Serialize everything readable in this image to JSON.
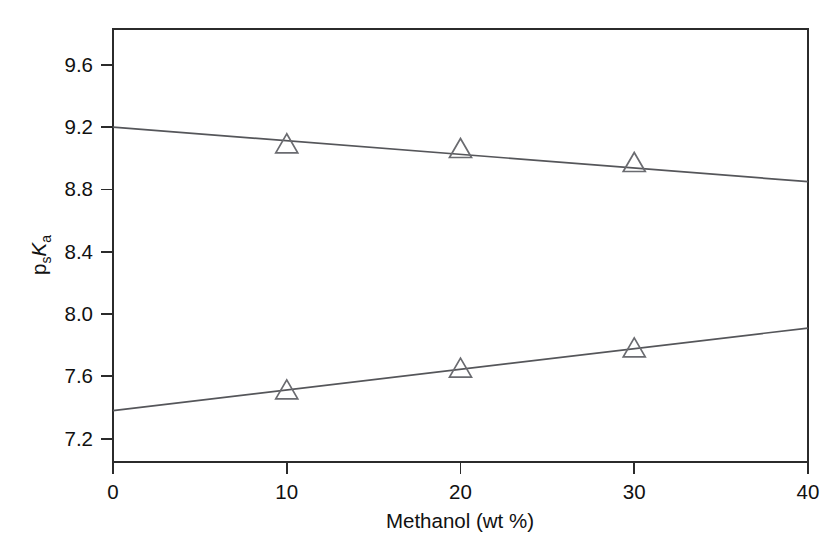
{
  "chart_data": {
    "type": "line",
    "title": "",
    "subtitle": "",
    "xlabel": "Methanol (wt %)",
    "ylabel": "p_sK_a",
    "ylabel_parts": {
      "base1": "p",
      "sub1": "s",
      "base2": "K",
      "sub2": "a"
    },
    "xlim": [
      0,
      40
    ],
    "ylim": [
      7.05,
      9.83
    ],
    "xticks": [
      0,
      10,
      20,
      30,
      40
    ],
    "xtick_labels": [
      "0",
      "10",
      "20",
      "30",
      "40"
    ],
    "yticks": [
      7.2,
      7.6,
      8.0,
      8.4,
      8.8,
      9.2,
      9.6
    ],
    "ytick_labels": [
      "7.2",
      "7.6",
      "8.0",
      "8.4",
      "8.8",
      "9.2",
      "9.6"
    ],
    "grid": false,
    "legend": null,
    "legend_position": "none",
    "marker": "open-triangle-up",
    "frame": "box",
    "series": [
      {
        "name": "upper",
        "fit_line": {
          "x": [
            0,
            40
          ],
          "y": [
            9.2,
            8.85
          ]
        },
        "x": [
          10,
          20,
          30
        ],
        "values": [
          9.09,
          9.06,
          8.97
        ],
        "line_color": "#55565a",
        "marker_color": "#6a6b70"
      },
      {
        "name": "lower",
        "fit_line": {
          "x": [
            0,
            40
          ],
          "y": [
            7.38,
            7.91
          ]
        },
        "x": [
          10,
          20,
          30
        ],
        "values": [
          7.51,
          7.65,
          7.78
        ],
        "line_color": "#55565a",
        "marker_color": "#6a6b70"
      }
    ]
  },
  "colors": {
    "background": "#ffffff",
    "axis": "#2b2b2b",
    "text": "#111111",
    "line": "#55565a",
    "marker": "#6a6b70"
  }
}
